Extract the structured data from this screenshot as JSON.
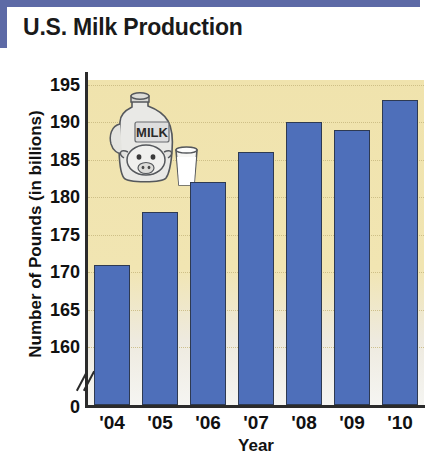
{
  "chart_title": "U.S. Milk Production",
  "illustration": {
    "name": "milk-jug-and-glass-illustration",
    "jug_label": "MILK"
  },
  "chart_data": {
    "type": "bar",
    "title": "U.S. Milk Production",
    "xlabel": "Year",
    "ylabel": "Number of Pounds (in billions)",
    "categories": [
      "'04",
      "'05",
      "'06",
      "'07",
      "'08",
      "'09",
      "'10"
    ],
    "values": [
      171,
      178,
      182,
      186,
      190,
      189,
      193
    ],
    "ytick_labels": [
      "0",
      "160",
      "165",
      "170",
      "175",
      "180",
      "185",
      "190",
      "195"
    ],
    "ytick_values": [
      0,
      160,
      165,
      170,
      175,
      180,
      185,
      190,
      195
    ],
    "ylim": [
      160,
      195
    ],
    "axis_break": true,
    "grid": true,
    "grid_style": "dotted",
    "legend": "none",
    "bar_color": "#4e6fba",
    "bar_border_color": "#2e3a52",
    "plot_background": "#f0e3ad",
    "accent_color": "#5d6aa6"
  }
}
